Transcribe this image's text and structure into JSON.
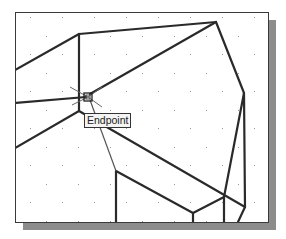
{
  "viewport": {
    "grid": {
      "spacing_x": 32,
      "spacing_y": 18.5,
      "dot_color": "#9a9a9a"
    },
    "line_color": "#2a2a2a",
    "shadow_color": "#8c8c8c",
    "lines": [
      {
        "x1": 15,
        "y1": 70,
        "x2": 79,
        "y2": 34
      },
      {
        "x1": 79,
        "y1": 34,
        "x2": 216,
        "y2": 22
      },
      {
        "x1": 79,
        "y1": 34,
        "x2": 79,
        "y2": 111
      },
      {
        "x1": 15,
        "y1": 103,
        "x2": 86,
        "y2": 97
      },
      {
        "x1": 90,
        "y1": 94,
        "x2": 216,
        "y2": 22
      },
      {
        "x1": 216,
        "y1": 22,
        "x2": 244,
        "y2": 93
      },
      {
        "x1": 244,
        "y1": 93,
        "x2": 245,
        "y2": 207
      },
      {
        "x1": 245,
        "y1": 207,
        "x2": 238,
        "y2": 222
      },
      {
        "x1": 79,
        "y1": 111,
        "x2": 15,
        "y2": 148
      },
      {
        "x1": 79,
        "y1": 111,
        "x2": 245,
        "y2": 207
      },
      {
        "x1": 244,
        "y1": 93,
        "x2": 224,
        "y2": 197
      },
      {
        "x1": 224,
        "y1": 197,
        "x2": 224,
        "y2": 222
      },
      {
        "x1": 224,
        "y1": 197,
        "x2": 193,
        "y2": 213
      },
      {
        "x1": 193,
        "y1": 213,
        "x2": 193,
        "y2": 222
      },
      {
        "x1": 116,
        "y1": 171,
        "x2": 193,
        "y2": 213
      },
      {
        "x1": 116,
        "y1": 171,
        "x2": 116,
        "y2": 222
      }
    ],
    "thin_lines": [
      {
        "x1": 90,
        "y1": 100,
        "x2": 116,
        "y2": 171
      }
    ],
    "snap_marker": {
      "x": 88,
      "y": 97,
      "size": 8
    },
    "tooltip": {
      "label": "Endpoint"
    }
  }
}
